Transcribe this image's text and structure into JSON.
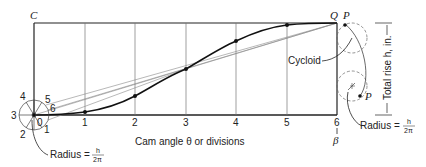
{
  "diagram": {
    "type": "cycloidal cam displacement construction",
    "corner_labels": {
      "top_left": "C",
      "top_right_q": "Q",
      "top_right_p": "P"
    },
    "x_axis": {
      "label": "Cam angle θ or divisions",
      "ticks": [
        "1",
        "2",
        "3",
        "4",
        "5",
        "6"
      ],
      "end_label": "β"
    },
    "y_axis": {
      "label": "Total rise h, in."
    },
    "circle_numbers": [
      "0",
      "1",
      "2",
      "3",
      "4",
      "5",
      "6"
    ],
    "annotations": {
      "cycloid": "Cycloid",
      "radius_left": "Radius = ",
      "radius_right": "Radius = ",
      "radius_fraction_num": "h",
      "radius_fraction_den": "2π",
      "rolling_point": "P"
    },
    "colors": {
      "stroke": "#222222",
      "light": "#777777",
      "background": "#ffffff"
    }
  }
}
